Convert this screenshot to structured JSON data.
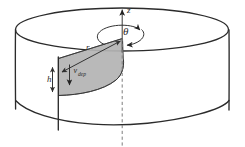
{
  "figure": {
    "domain": "diagram",
    "width": 245,
    "height": 147,
    "background_color": "#ffffff",
    "ink_color": "#2b2b2b",
    "shade_color": "#b3b3b3",
    "dashed_axis_color": "#7d7d7d"
  },
  "labels": {
    "axis_z": "z",
    "angle_theta": "θ",
    "radius_r": "r",
    "height_h": "h",
    "velocity_symbol": "v",
    "velocity_subscript": "dep"
  },
  "annotations": {
    "z_axis": {
      "name": "vertical-axis",
      "label": "z",
      "direction": "up",
      "style": "solid arrow above tank, dashed below"
    },
    "theta_arrow": {
      "name": "rotation-arrow",
      "label": "θ",
      "direction": "counterclockwise about z",
      "style": "circular arc with arrowhead"
    },
    "r_arrow": {
      "name": "radius-arrow",
      "label": "r",
      "style": "double headed arrow from axis to wall"
    },
    "h_arrow": {
      "name": "height-arrow",
      "label": "h",
      "style": "double headed vertical arrow at outer wall"
    },
    "v_arrow": {
      "name": "velocity-arrow",
      "label": "v_dep",
      "direction": "downward",
      "style": "single headed arrow pointing down"
    }
  },
  "geometry": {
    "cylinder": {
      "center_x": 122,
      "top_ellipse_cy": 29,
      "top_ellipse_rx": 107,
      "top_ellipse_ry": 21,
      "wall_height": 70,
      "left_wall_x": 15,
      "right_wall_x": 229
    },
    "shaded_element": {
      "description": "radial slab of thickness h spanning from axis to wall",
      "inner_x": 122,
      "outer_x": 58,
      "top_y_at_outer": 58,
      "bottom_y_at_outer": 95
    }
  },
  "colors": {
    "ink": "#2b2b2b",
    "shade_fill": "#b3b3b3",
    "shade_stroke": "#555555",
    "dashed": "#7d7d7d",
    "background": "#ffffff"
  }
}
